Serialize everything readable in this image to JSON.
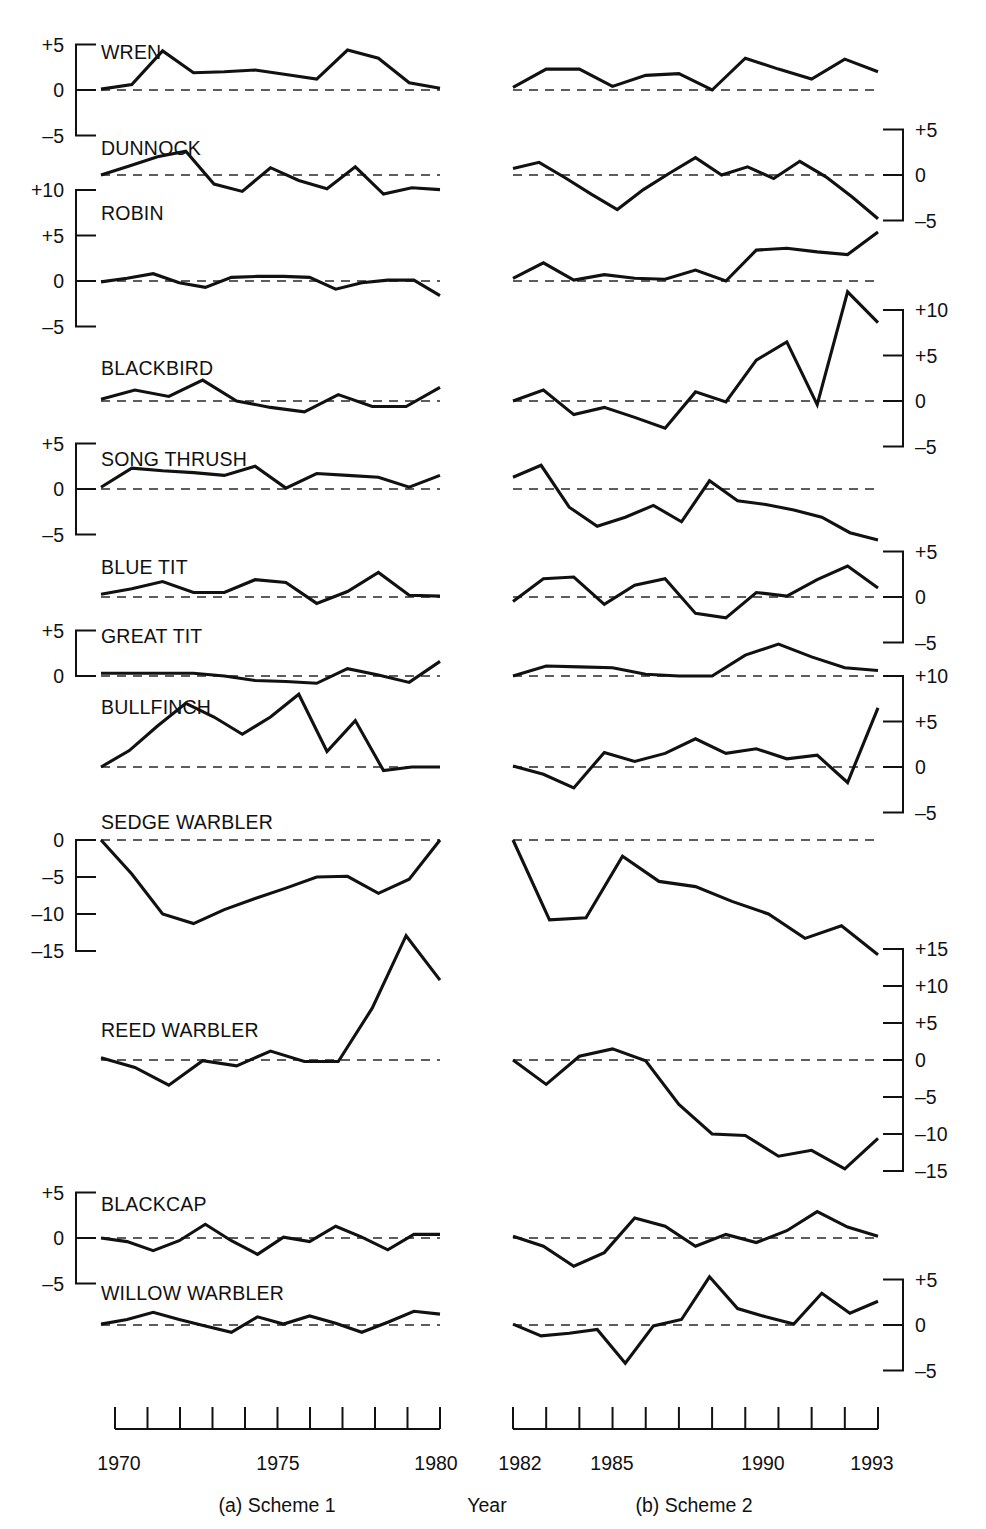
{
  "figure": {
    "year_axis_label": "Year",
    "caption_left": "(a) Scheme 1",
    "caption_right": "(b) Scheme 2"
  },
  "axes": {
    "scheme1": {
      "start_year": 1970,
      "end_year": 1980,
      "tick_labels": [
        "1970",
        "1975",
        "1980"
      ],
      "n_ticks": 11
    },
    "scheme2": {
      "start_year": 1982,
      "end_year": 1993,
      "tick_labels": [
        "1982",
        "1985",
        "1990",
        "1993"
      ],
      "n_ticks": 12
    }
  },
  "chart_data": {
    "type": "line",
    "title": "",
    "xlabel": "Year",
    "ylabel": "",
    "grid": false,
    "legend": null,
    "panels_note": "Each species row has two panels: (a) Scheme 1 covering 1970-1980 and (b) Scheme 2 covering 1982-1993. A dashed horizontal line marks zero. Axis brackets with tick labels appear on the left for some species and on the right for others.",
    "x_scheme1": [
      1970,
      1971,
      1972,
      1973,
      1974,
      1975,
      1976,
      1977,
      1978,
      1979,
      1980
    ],
    "x_scheme2": [
      1982,
      1983,
      1984,
      1985,
      1986,
      1987,
      1988,
      1989,
      1990,
      1991,
      1992,
      1993
    ],
    "series": [
      {
        "name": "WREN",
        "axis_side": "left",
        "ylim": [
          -5,
          5
        ],
        "ticks": [
          5,
          0,
          -5
        ],
        "tick_labels": [
          "+5",
          "0",
          "-5"
        ],
        "scheme1": [
          0.1,
          0.6,
          4.3,
          1.9,
          2.0,
          2.2,
          1.7,
          1.2,
          4.4,
          3.5,
          0.8,
          0.2
        ],
        "scheme2": [
          0.3,
          2.3,
          2.3,
          0.4,
          1.6,
          1.8,
          0.0,
          3.5,
          2.3,
          1.2,
          3.4,
          2.0
        ]
      },
      {
        "name": "DUNNOCK",
        "axis_side": "right",
        "ylim": [
          -5,
          5
        ],
        "ticks": [
          5,
          0,
          -5
        ],
        "tick_labels": [
          "+5",
          "0",
          "-5"
        ],
        "scheme1": [
          0.0,
          1.0,
          2.0,
          2.6,
          -1.0,
          -1.8,
          0.8,
          -0.6,
          -1.5,
          0.9,
          -2.1,
          -1.4,
          -1.6
        ],
        "scheme2": [
          0.7,
          1.4,
          -0.3,
          -2.1,
          -3.8,
          -1.6,
          0.2,
          1.9,
          0.0,
          0.9,
          -0.4,
          1.5,
          -0.2,
          -2.4,
          -4.8
        ]
      },
      {
        "name": "ROBIN",
        "axis_side": "left",
        "ylim": [
          -5,
          10
        ],
        "ticks": [
          10,
          5,
          0,
          -5
        ],
        "tick_labels": [
          "+10",
          "+5",
          "0",
          "-5"
        ],
        "scheme1": [
          -0.1,
          0.3,
          0.8,
          -0.2,
          -0.7,
          0.4,
          0.5,
          0.5,
          0.4,
          -0.9,
          -0.2,
          0.1,
          0.1,
          -1.6
        ],
        "scheme2": [
          0.3,
          2.0,
          0.1,
          0.7,
          0.3,
          0.2,
          1.2,
          0.0,
          3.4,
          3.6,
          3.2,
          2.9,
          5.4
        ]
      },
      {
        "name": "BLACKBIRD",
        "axis_side": "right",
        "ylim": [
          -5,
          10
        ],
        "ticks": [
          10,
          5,
          0,
          -5
        ],
        "tick_labels": [
          "+10",
          "+5",
          "0",
          "-5"
        ],
        "scheme1": [
          0.2,
          1.2,
          0.5,
          2.3,
          0.0,
          -0.7,
          -1.2,
          0.7,
          -0.6,
          -0.6,
          1.5
        ],
        "scheme2": [
          0.0,
          1.2,
          -1.5,
          -0.7,
          -1.8,
          -3.0,
          1.0,
          -0.1,
          4.5,
          6.5,
          -0.4,
          12.0,
          8.6
        ]
      },
      {
        "name": "SONG THRUSH",
        "axis_side": "left",
        "ylim": [
          -5,
          5
        ],
        "ticks": [
          5,
          0,
          -5
        ],
        "tick_labels": [
          "+5",
          "0",
          "-5"
        ],
        "scheme1": [
          0.2,
          2.3,
          2.0,
          1.8,
          1.5,
          2.5,
          0.1,
          1.7,
          1.5,
          1.3,
          0.2,
          1.5
        ],
        "scheme2": [
          1.3,
          2.6,
          -2.0,
          -4.1,
          -3.1,
          -1.8,
          -3.6,
          0.9,
          -1.3,
          -1.7,
          -2.3,
          -3.1,
          -4.8,
          -5.6
        ]
      },
      {
        "name": "BLUE TIT",
        "axis_side": "right",
        "ylim": [
          -5,
          5
        ],
        "ticks": [
          5,
          0,
          -5
        ],
        "tick_labels": [
          "+5",
          "0",
          "-5"
        ],
        "scheme1": [
          0.3,
          0.9,
          1.7,
          0.5,
          0.5,
          1.9,
          1.6,
          -0.7,
          0.6,
          2.7,
          0.2,
          0.1
        ],
        "scheme2": [
          -0.5,
          2.0,
          2.2,
          -0.8,
          1.3,
          2.0,
          -1.8,
          -2.3,
          0.5,
          0.1,
          1.9,
          3.4,
          1.0
        ]
      },
      {
        "name": "GREAT TIT",
        "axis_side": "left",
        "ylim": [
          -2,
          5
        ],
        "ticks": [
          5,
          0
        ],
        "tick_labels": [
          "+5",
          "0"
        ],
        "scheme1": [
          0.3,
          0.3,
          0.3,
          0.3,
          0.0,
          -0.5,
          -0.6,
          -0.8,
          0.8,
          0.1,
          -0.7,
          1.6
        ],
        "scheme2": [
          0.0,
          1.1,
          1.0,
          0.9,
          0.2,
          0.0,
          0.0,
          2.3,
          3.5,
          2.1,
          0.9,
          0.6
        ]
      },
      {
        "name": "BULLFINCH",
        "axis_side": "right",
        "ylim": [
          -5,
          10
        ],
        "ticks": [
          10,
          5,
          0,
          -5
        ],
        "tick_labels": [
          "+10",
          "+5",
          "0",
          "-5"
        ],
        "scheme1": [
          0.0,
          1.8,
          4.5,
          7.0,
          5.5,
          3.6,
          5.5,
          8.0,
          1.7,
          5.1,
          -0.4,
          0.0,
          0.0
        ],
        "scheme2": [
          0.1,
          -0.8,
          -2.3,
          1.6,
          0.6,
          1.5,
          3.1,
          1.5,
          2.0,
          0.9,
          1.3,
          -1.7,
          6.5
        ]
      },
      {
        "name": "SEDGE WARBLER",
        "axis_side": "left",
        "ylim": [
          -15,
          0
        ],
        "ticks": [
          0,
          -5,
          -10,
          -15
        ],
        "tick_labels": [
          "0",
          "-5",
          "-10",
          "-15"
        ],
        "scheme1": [
          0.0,
          -4.6,
          -10.0,
          -11.3,
          -9.4,
          -7.9,
          -6.5,
          -5.0,
          -4.9,
          -7.2,
          -5.3,
          0.0
        ],
        "scheme2": [
          0.0,
          -10.8,
          -10.5,
          -2.2,
          -5.6,
          -6.3,
          -8.3,
          -10.0,
          -13.3,
          -11.6,
          -15.5
        ]
      },
      {
        "name": "REED WARBLER",
        "axis_side": "right",
        "ylim": [
          -15,
          15
        ],
        "ticks": [
          15,
          10,
          5,
          0,
          -5,
          -10,
          -15
        ],
        "tick_labels": [
          "+15",
          "+10",
          "+5",
          "0",
          "-5",
          "-10",
          "-15"
        ],
        "scheme1": [
          0.3,
          -1.0,
          -3.4,
          -0.1,
          -0.8,
          1.2,
          -0.2,
          -0.2,
          7.0,
          16.8,
          10.8
        ],
        "scheme2": [
          0.0,
          -3.3,
          0.5,
          1.5,
          -0.1,
          -6.0,
          -10.0,
          -10.2,
          -13.0,
          -12.2,
          -14.7,
          -10.6
        ]
      },
      {
        "name": "BLACKCAP",
        "axis_side": "left",
        "ylim": [
          -5,
          5
        ],
        "ticks": [
          5,
          0,
          -5
        ],
        "tick_labels": [
          "+5",
          "0",
          "-5"
        ],
        "scheme1": [
          0.0,
          -0.4,
          -1.4,
          -0.3,
          1.5,
          -0.3,
          -1.8,
          0.1,
          -0.4,
          1.3,
          0.1,
          -1.3,
          0.4,
          0.4
        ],
        "scheme2": [
          0.2,
          -0.9,
          -3.1,
          -1.6,
          2.2,
          1.3,
          -0.9,
          0.4,
          -0.5,
          0.8,
          2.9,
          1.2,
          0.2
        ]
      },
      {
        "name": "WILLOW WARBLER",
        "axis_side": "right",
        "ylim": [
          -5,
          5
        ],
        "ticks": [
          5,
          0,
          -5
        ],
        "tick_labels": [
          "+5",
          "0",
          "-5"
        ],
        "scheme1": [
          0.1,
          0.6,
          1.4,
          0.6,
          -0.1,
          -0.8,
          0.9,
          0.1,
          1.0,
          0.2,
          -0.8,
          0.3,
          1.5,
          1.2
        ],
        "scheme2": [
          0.1,
          -1.2,
          -0.9,
          -0.5,
          -4.2,
          -0.1,
          0.6,
          5.3,
          1.8,
          0.9,
          0.1,
          3.5,
          1.3,
          2.6
        ]
      }
    ]
  }
}
